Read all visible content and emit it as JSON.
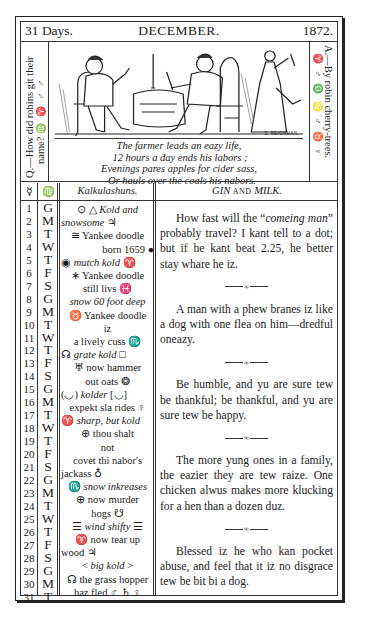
{
  "header": {
    "days": "31 Days.",
    "month": "DECEMBER.",
    "year": "1872."
  },
  "side_question": {
    "text": "Q.—How did robins git their name?",
    "line1": "Q.—How did robins git their",
    "line2": "name?",
    "symbols": "♍ ♈ ♂ ♂"
  },
  "side_answer": {
    "text": "A.—By robin cherry-trees.",
    "symbols": "♈ ♂ ♎ ♌ ♂ ♉ ♀"
  },
  "illustration": {
    "description": "farmer-and-guest-at-table-engraving",
    "signature": "S. REIGHMAN."
  },
  "verse": [
    "The farmer leads an eazy life,",
    "12 hours a day ends his labors ;",
    "Evenings pares apples for cider sass,",
    "Or hauls over the coals his nabors."
  ],
  "table": {
    "col_day_symbol": "☿",
    "col_weekday_symbol": "♍",
    "col_kalk": "Kalkulashuns.",
    "col_gin_a": "GIN",
    "col_gin_and": "AND",
    "col_gin_b": "MILK."
  },
  "days": [
    "1",
    "2",
    "3",
    "4",
    "5",
    "6",
    "7",
    "8",
    "9",
    "10",
    "11",
    "12",
    "13",
    "14",
    "15",
    "16",
    "17",
    "18",
    "19",
    "20",
    "21",
    "22",
    "23",
    "24",
    "25",
    "26",
    "27",
    "28",
    "29",
    "30",
    "31"
  ],
  "weekdays": [
    "G",
    "M",
    "T",
    "W",
    "T",
    "F",
    "S",
    "G",
    "M",
    "T",
    "W",
    "T",
    "F",
    "S",
    "G",
    "M",
    "T",
    "W",
    "T",
    "F",
    "S",
    "G",
    "M",
    "T",
    "W",
    "T",
    "F",
    "S",
    "G",
    "M",
    "T"
  ],
  "kalkulashuns": [
    {
      "text": "⊙ △ ",
      "italic": "Kold and",
      "align": "c"
    },
    {
      "text": "",
      "italic": "snowsome",
      "tail": " ♃",
      "align": "l"
    },
    {
      "text": "≅ Yankee doodle",
      "align": "c"
    },
    {
      "text": "born 1659 ●",
      "align": "r"
    },
    {
      "text": "◉ ",
      "italic": "mutch kold",
      "tail": " ♈",
      "align": "l"
    },
    {
      "text": "∗ Yankee doodle",
      "align": "c"
    },
    {
      "text": "still livs ♓",
      "align": "c"
    },
    {
      "text": "",
      "italic": "snow 60 foot deep",
      "align": "c"
    },
    {
      "text": "♉ Yankee doodle",
      "align": "c"
    },
    {
      "text": "iz",
      "align": "c"
    },
    {
      "text": "a lively cuss ♏",
      "align": "c"
    },
    {
      "text": "☊ ",
      "italic": "grate kold",
      "tail": " □",
      "align": "l"
    },
    {
      "text": "♅ now hammer",
      "align": "c"
    },
    {
      "text": "out oats ❂",
      "align": "c"
    },
    {
      "text": "(◡) ",
      "italic": "kolder",
      "tail": " [◡]",
      "align": "l"
    },
    {
      "text": "expekt sla rides ♀",
      "align": "c"
    },
    {
      "text": "♈ ",
      "italic": "sharp, but kold",
      "align": "l"
    },
    {
      "text": "⊕ thou shalt",
      "align": "c"
    },
    {
      "text": "not",
      "align": "c"
    },
    {
      "text": "covet thi nabor's",
      "align": "c"
    },
    {
      "text": "jackass ♁",
      "align": "l"
    },
    {
      "text": "♏ ",
      "italic": "snow inkreases",
      "align": "c"
    },
    {
      "text": "⊕ now murder",
      "align": "c"
    },
    {
      "text": "hogs ☋",
      "align": "c"
    },
    {
      "text": "☰ ",
      "italic": "wind shifty",
      "tail": " ☰",
      "align": "c"
    },
    {
      "text": "♈ now tear up",
      "align": "c"
    },
    {
      "text": "wood ♃",
      "align": "l"
    },
    {
      "text": "< ",
      "italic": "big kold",
      "tail": " >",
      "align": "c"
    },
    {
      "text": "☊ the grass hopper",
      "align": "c"
    },
    {
      "text": "haz fled ♂ ♄ ♀",
      "align": "c"
    }
  ],
  "essay": {
    "p1_a": "How fast will the “",
    "p1_italic": "comeing man",
    "p1_b": "” probably travel? I kant tell to a dot; but if he kant beat 2.25, he better stay whare he iz.",
    "p2": "A man with a phew branes iz like a dog with one flea on him—dredful oneazy.",
    "p3": "Be humble, and yu are sure tew be thankful; be thankful, and yu are sure tew be happy.",
    "p4": "The more yung ones in a family, the eazier they are tew raize. One chicken alwus makes more klucking for a hen than a dozen duz.",
    "p5": "Blessed iz he who kan pocket abuse, and feel that it iz no disgrace tew be bit bi a dog.",
    "ornament": "∞"
  }
}
